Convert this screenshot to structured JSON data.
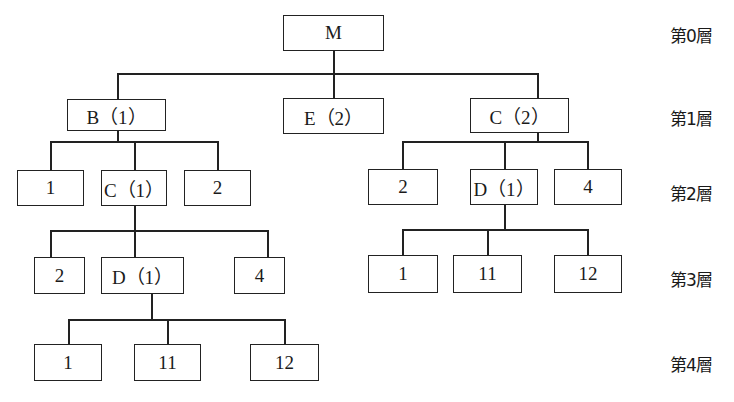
{
  "levels": [
    "第0層",
    "第1層",
    "第2層",
    "第3層",
    "第4層"
  ],
  "nodes": {
    "root": "M",
    "l1_b": "B（1）",
    "l1_e": "E（2）",
    "l1_c": "C（2）",
    "b_l2_1": "1",
    "b_l2_c": "C（1）",
    "b_l2_2": "2",
    "bc_l3_2": "2",
    "bc_l3_d": "D（1）",
    "bc_l3_4": "4",
    "bcd_l4_1": "1",
    "bcd_l4_11": "11",
    "bcd_l4_12": "12",
    "c_l2_2": "2",
    "c_l2_d": "D（1）",
    "c_l2_4": "4",
    "cd_l3_1": "1",
    "cd_l3_11": "11",
    "cd_l3_12": "12"
  },
  "caption": ""
}
